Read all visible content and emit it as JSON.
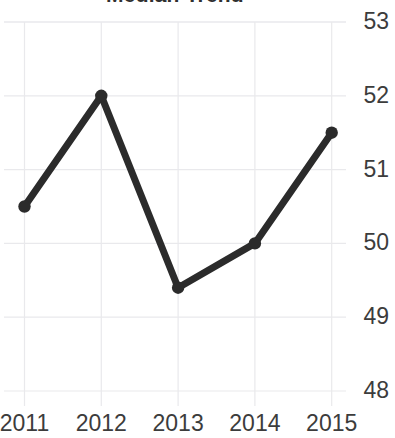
{
  "chart_data": {
    "type": "line",
    "title": "Median Trend",
    "xlabel": "",
    "ylabel": "",
    "categories": [
      "2011",
      "2012",
      "2013",
      "2014",
      "2015"
    ],
    "x": [
      2011,
      2012,
      2013,
      2014,
      2015
    ],
    "values": [
      50.5,
      52.0,
      49.4,
      50.0,
      51.5
    ],
    "series": [
      {
        "name": "Trend",
        "values": [
          50.5,
          52.0,
          49.4,
          50.0,
          51.5
        ],
        "color": "#2b2b2b",
        "marker": "circle",
        "line_width": 7
      }
    ],
    "ylim": [
      47.8,
      53.1
    ],
    "yticks": [
      48,
      49,
      50,
      51,
      52,
      53
    ],
    "ytick_labels": [
      "48",
      "49",
      "50",
      "51",
      "52",
      "53"
    ],
    "ytick_side": "right",
    "xticks": [
      2011,
      2012,
      2013,
      2014,
      2015
    ],
    "xtick_labels": [
      "2011",
      "2012",
      "2013",
      "2014",
      "2015"
    ],
    "grid": true,
    "grid_color": "#e9e9ec",
    "legend": false,
    "legend_position": "none",
    "background": "#ffffff",
    "text_color": "#3c3c3c"
  }
}
